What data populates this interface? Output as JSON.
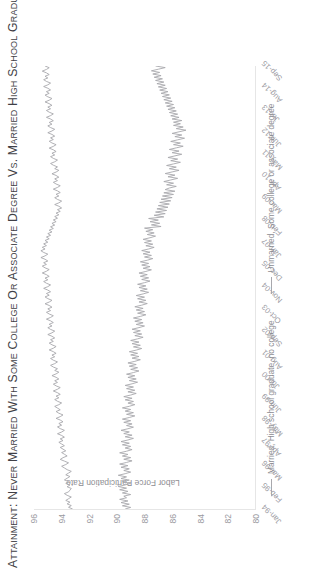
{
  "figure": {
    "title": "Attainment: Never Married with Some College or Associate Degree vs. Married High School Graduate",
    "title_ghost": ""
  },
  "legend": {
    "position": "bottom",
    "items": [
      {
        "label": "Married, High school graduate, no college",
        "color": "#a8a8ad"
      },
      {
        "label": "Unmarried, Some college or associate degree",
        "color": "#a8a8ad"
      }
    ]
  },
  "chart_data": {
    "type": "line",
    "title": "Attainment: Never Married with Some College or Associate Degree vs. Married High School Graduate",
    "xlabel": "",
    "ylabel": "Labor Force Participation Rate",
    "ylim": [
      80,
      96
    ],
    "yticks": [
      80,
      82,
      84,
      86,
      88,
      90,
      92,
      94,
      96
    ],
    "grid": false,
    "x_tick_labels": [
      "Jan-94",
      "Feb-95",
      "Mar-96",
      "Apr-97",
      "May-98",
      "Jun-99",
      "Jul-00",
      "Aug-01",
      "Sep-02",
      "Oct-03",
      "Nov-04",
      "Dec-05",
      "Jan-07",
      "Feb-08",
      "Mar-09",
      "Apr-10",
      "May-11",
      "Jun-12",
      "Jul-13",
      "Aug-14",
      "Sep-15"
    ],
    "x_tick_interval_months": 13,
    "x_start": "Jan-94",
    "x_end": "Sep-15",
    "series": [
      {
        "name": "Married, High school graduate, no college",
        "color": "#a8a8ad",
        "values": [
          93.2,
          93.5,
          93.3,
          93.6,
          93.4,
          93.7,
          93.5,
          93.3,
          93.6,
          93.8,
          93.5,
          93.4,
          93.3,
          93.6,
          93.4,
          93.7,
          93.5,
          93.8,
          93.6,
          93.4,
          93.7,
          93.5,
          93.3,
          93.6,
          93.8,
          94.0,
          93.7,
          93.5,
          93.8,
          94.1,
          93.9,
          93.6,
          93.8,
          94.0,
          93.7,
          93.9,
          94.1,
          93.8,
          94.0,
          94.2,
          93.9,
          94.1,
          93.8,
          94.0,
          94.3,
          94.0,
          93.8,
          94.1,
          94.3,
          94.0,
          94.2,
          93.9,
          94.1,
          94.4,
          94.1,
          93.9,
          94.2,
          94.4,
          94.1,
          94.3,
          94.5,
          94.2,
          94.0,
          94.3,
          94.5,
          94.2,
          94.4,
          94.1,
          94.3,
          94.6,
          94.3,
          94.1,
          94.4,
          94.6,
          94.3,
          94.5,
          94.2,
          94.4,
          94.7,
          94.4,
          94.2,
          94.5,
          94.3,
          94.6,
          94.8,
          94.5,
          94.3,
          94.6,
          94.8,
          94.5,
          94.7,
          94.4,
          94.6,
          94.9,
          94.6,
          94.4,
          94.7,
          94.9,
          94.6,
          94.8,
          94.5,
          94.7,
          95.0,
          94.7,
          94.5,
          94.8,
          95.0,
          94.7,
          94.9,
          94.6,
          94.8,
          95.1,
          94.8,
          94.6,
          94.9,
          95.1,
          94.8,
          95.0,
          94.7,
          94.9,
          95.2,
          94.9,
          94.7,
          95.0,
          95.2,
          94.9,
          95.1,
          94.8,
          95.0,
          95.3,
          95.0,
          94.8,
          95.1,
          95.3,
          95.0,
          95.2,
          94.9,
          95.1,
          95.4,
          95.1,
          94.9,
          95.2,
          95.4,
          95.1,
          95.3,
          95.0,
          95.2,
          95.5,
          95.2,
          95.0,
          95.3,
          95.5,
          95.2,
          95.4,
          95.1,
          95.3,
          95.0,
          95.2,
          94.9,
          95.1,
          94.8,
          95.0,
          94.7,
          94.9,
          94.6,
          94.8,
          94.5,
          94.7,
          94.4,
          94.6,
          94.3,
          94.5,
          94.2,
          94.4,
          94.1,
          94.3,
          94.0,
          94.2,
          94.5,
          94.2,
          94.0,
          94.3,
          94.5,
          94.2,
          94.4,
          94.1,
          94.3,
          94.6,
          94.3,
          94.1,
          94.4,
          94.6,
          94.3,
          94.5,
          94.2,
          94.4,
          94.7,
          94.4,
          94.2,
          94.5,
          94.3,
          94.6,
          94.8,
          94.5,
          94.3,
          94.6,
          94.8,
          94.5,
          94.7,
          94.4,
          94.6,
          94.9,
          94.6,
          94.4,
          94.7,
          94.9,
          94.6,
          94.8,
          94.5,
          94.7,
          95.0,
          94.7,
          94.5,
          94.8,
          95.0,
          94.7,
          94.9,
          94.6,
          94.8,
          95.1,
          94.8,
          94.6,
          94.9,
          95.1,
          94.8,
          95.0,
          94.7,
          94.9,
          95.2,
          94.9,
          94.7,
          95.0,
          95.2,
          94.9,
          95.1,
          94.8,
          95.0,
          95.3,
          95.0,
          94.8,
          95.1,
          95.3,
          95.0,
          95.2,
          94.9,
          95.1,
          95.4,
          95.1,
          94.9,
          95.2
        ]
      },
      {
        "name": "Unmarried, Some college or associate degree",
        "color": "#a8a8ad",
        "values": [
          89.4,
          89.0,
          89.6,
          89.1,
          89.7,
          89.2,
          89.8,
          89.3,
          89.5,
          89.0,
          89.6,
          89.2,
          89.8,
          89.3,
          89.9,
          89.4,
          89.0,
          89.6,
          89.1,
          89.7,
          89.3,
          89.9,
          89.4,
          89.0,
          89.5,
          89.1,
          89.7,
          89.2,
          89.8,
          89.3,
          88.9,
          89.5,
          89.0,
          89.6,
          89.2,
          89.8,
          89.3,
          88.9,
          89.4,
          89.0,
          89.6,
          89.1,
          89.7,
          89.2,
          88.8,
          89.4,
          88.9,
          89.5,
          89.1,
          89.7,
          89.2,
          88.8,
          89.3,
          88.9,
          89.5,
          89.0,
          89.6,
          89.1,
          88.7,
          89.3,
          88.8,
          89.4,
          89.0,
          89.6,
          89.1,
          88.7,
          89.2,
          88.8,
          89.4,
          88.9,
          89.5,
          89.0,
          88.6,
          89.2,
          88.7,
          89.3,
          88.8,
          89.4,
          88.9,
          88.5,
          89.1,
          88.6,
          89.2,
          88.7,
          89.3,
          88.8,
          88.4,
          89.0,
          88.5,
          89.1,
          88.6,
          89.2,
          88.7,
          88.3,
          88.9,
          88.4,
          89.0,
          88.5,
          89.1,
          88.6,
          88.2,
          88.8,
          88.3,
          88.9,
          88.4,
          89.0,
          88.5,
          88.1,
          88.7,
          88.2,
          88.8,
          88.3,
          88.9,
          88.4,
          88.0,
          88.6,
          88.1,
          88.7,
          88.2,
          88.8,
          88.3,
          87.9,
          88.5,
          88.0,
          88.6,
          88.1,
          88.7,
          88.2,
          87.8,
          88.4,
          87.9,
          88.5,
          88.0,
          88.6,
          88.1,
          87.7,
          88.3,
          87.8,
          88.4,
          87.9,
          88.5,
          88.0,
          87.6,
          88.2,
          87.7,
          88.3,
          87.8,
          88.4,
          87.9,
          87.5,
          88.1,
          87.6,
          88.2,
          87.7,
          88.3,
          87.8,
          87.4,
          88.0,
          87.5,
          88.1,
          87.6,
          88.2,
          87.7,
          87.3,
          87.9,
          87.4,
          88.0,
          87.5,
          88.1,
          87.6,
          87.2,
          87.8,
          87.3,
          87.9,
          87.4,
          88.0,
          86.8,
          87.5,
          86.9,
          87.6,
          87.0,
          87.7,
          86.6,
          87.3,
          86.5,
          87.2,
          86.4,
          87.1,
          86.3,
          87.0,
          86.2,
          86.9,
          86.1,
          86.8,
          86.0,
          86.7,
          85.9,
          86.6,
          85.8,
          86.5,
          86.2,
          85.7,
          86.4,
          85.9,
          86.6,
          86.1,
          85.6,
          86.3,
          85.8,
          86.5,
          86.0,
          85.5,
          86.2,
          85.7,
          86.4,
          85.9,
          85.4,
          86.1,
          85.6,
          86.3,
          85.8,
          85.3,
          86.0,
          85.5,
          86.2,
          85.7,
          85.2,
          85.9,
          85.4,
          86.1,
          85.6,
          85.1,
          85.8,
          85.3,
          86.0,
          85.5,
          85.0,
          85.7,
          85.2,
          85.9,
          85.4,
          85.9,
          85.3,
          86.0,
          85.5,
          86.1,
          85.6,
          86.2,
          85.7,
          86.3,
          85.8,
          86.4,
          85.9,
          86.5,
          86.0,
          86.6,
          86.1,
          86.7,
          86.2,
          86.8,
          86.3,
          86.9,
          86.4,
          87.0,
          86.5,
          87.1,
          86.6,
          87.2,
          86.7,
          87.3,
          86.8,
          87.4,
          86.9,
          87.5,
          87.0,
          86.5,
          87.2
        ]
      }
    ]
  }
}
